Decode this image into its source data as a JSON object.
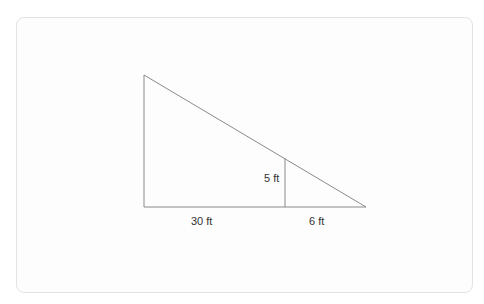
{
  "diagram": {
    "type": "similar-triangles",
    "labels": {
      "small_height": "5 ft",
      "base_left": "30 ft",
      "base_right": "6 ft"
    },
    "colors": {
      "line": "#8a8a8a",
      "text": "#333333",
      "frame": "#e3e3e3"
    }
  }
}
